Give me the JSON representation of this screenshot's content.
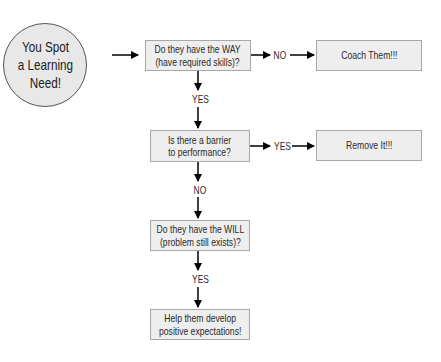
{
  "diagram": {
    "start": {
      "lines": [
        "You Spot",
        "a Learning",
        "Need!"
      ]
    },
    "nodes": {
      "way": {
        "lines": [
          "Do they have the WAY",
          "(have required skills)?"
        ]
      },
      "coach": {
        "lines": [
          "Coach Them!!!"
        ]
      },
      "barrier": {
        "lines": [
          "Is there a barrier",
          "to performance?"
        ]
      },
      "remove": {
        "lines": [
          "Remove It!!!"
        ]
      },
      "will": {
        "lines": [
          "Do they have the WILL",
          "(problem still exists)?"
        ]
      },
      "help": {
        "lines": [
          "Help them develop",
          "positive expectations!"
        ]
      }
    },
    "edges": [
      {
        "from": "start",
        "to": "way",
        "label": ""
      },
      {
        "from": "way",
        "to": "coach",
        "label": "NO"
      },
      {
        "from": "way",
        "to": "barrier",
        "label": "YES"
      },
      {
        "from": "barrier",
        "to": "remove",
        "label": "YES"
      },
      {
        "from": "barrier",
        "to": "will",
        "label": "NO"
      },
      {
        "from": "will",
        "to": "help",
        "label": "YES"
      }
    ],
    "colors": {
      "box_fill": "#eeeeee",
      "box_border": "#a8a8a8",
      "circle_fill": "#e8e8e8",
      "arrow": "#000000",
      "text": "#2a2a2a"
    }
  }
}
